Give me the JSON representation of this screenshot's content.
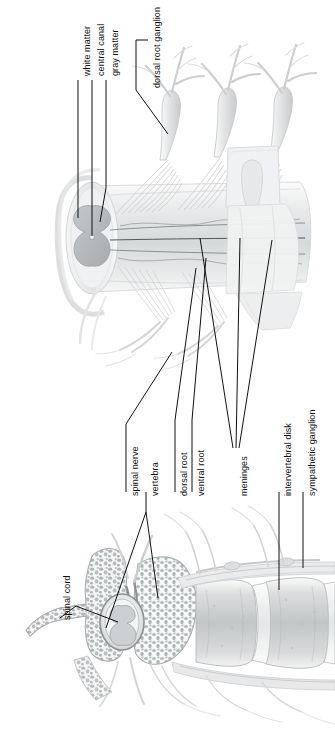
{
  "figure": {
    "orientation": "rotated-90",
    "style": "grayscale anatomical illustration",
    "palette": {
      "background": "#ffffff",
      "leader_line": "#101010",
      "label_text": "#101010",
      "gray_matter": "#b9bdc0",
      "white_matter": "#e6e8ea",
      "nerve": "#dcdedf",
      "bone_cortical": "#c9cbcc",
      "bone_trabecular": "#b4b7b9",
      "disk": "#d2d4d5",
      "meninges": "#9ea2a5"
    }
  },
  "labels": [
    {
      "id": "white-matter",
      "text": "white matter",
      "x": 78,
      "y": 72,
      "lines": 1
    },
    {
      "id": "central-canal",
      "text": "central canal",
      "x": 92,
      "y": 72,
      "lines": 1
    },
    {
      "id": "gray-matter",
      "text": "gray matter",
      "x": 106,
      "y": 72,
      "lines": 1
    },
    {
      "id": "dorsal-root-ganglion",
      "text": "dorsal root ganglion",
      "x": 148,
      "y": 96,
      "lines": 2
    },
    {
      "id": "spinal-nerve",
      "text": "spinal nerve",
      "x": 126,
      "y": 500,
      "lines": 1
    },
    {
      "id": "vertebra",
      "text": "vertebra",
      "x": 146,
      "y": 500,
      "lines": 1
    },
    {
      "id": "dorsal-root",
      "text": "dorsal root",
      "x": 175,
      "y": 500,
      "lines": 1
    },
    {
      "id": "ventral-root",
      "text": "ventral root",
      "x": 192,
      "y": 500,
      "lines": 1
    },
    {
      "id": "meninges",
      "text": "meninges",
      "x": 235,
      "y": 500,
      "lines": 1
    },
    {
      "id": "intervertebral-disk",
      "text": "intervertebral disk",
      "x": 279,
      "y": 500,
      "lines": 1
    },
    {
      "id": "sympathetic-ganglion",
      "text": "sympathetic ganglion",
      "x": 303,
      "y": 500,
      "lines": 1
    },
    {
      "id": "spinal-cord",
      "text": "spinal cord",
      "x": 58,
      "y": 625,
      "lines": 1
    }
  ],
  "structures": {
    "upper_panel": {
      "name": "spinal cord cutaway with dorsal root ganglia",
      "parts": [
        "white matter",
        "gray matter",
        "central canal",
        "dorsal root",
        "ventral root",
        "dorsal root ganglion",
        "spinal nerve",
        "meninges"
      ]
    },
    "lower_panel": {
      "name": "vertebral column midsagittal section",
      "parts": [
        "spinal cord",
        "vertebra",
        "intervertebral disk",
        "sympathetic ganglion",
        "meninges"
      ]
    }
  }
}
